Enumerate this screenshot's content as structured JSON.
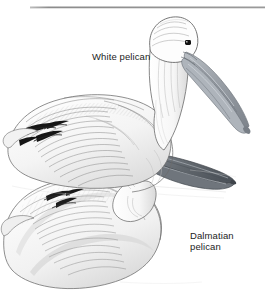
{
  "figure": {
    "name": "two-pelicans-illustration",
    "medium": "pen-and-ink line drawing",
    "background_color": "#ffffff",
    "width": 265,
    "height": 298
  },
  "rule": {
    "name": "top-horizontal-rule",
    "color": "#8c8c8c"
  },
  "labels": {
    "white_pelican": "White pelican",
    "dalmatian_pelican": "Dalmatian\npelican"
  },
  "colors": {
    "ink": "#1d1d1d",
    "line": "#555555",
    "mid_grey": "#9a9a9a",
    "light_grey": "#cfcfcf",
    "pale_grey": "#e8e8e8",
    "bill_grey": "#8e949b",
    "bill_dark": "#5a6068",
    "eye": "#141414",
    "rule": "#8c8c8c"
  }
}
